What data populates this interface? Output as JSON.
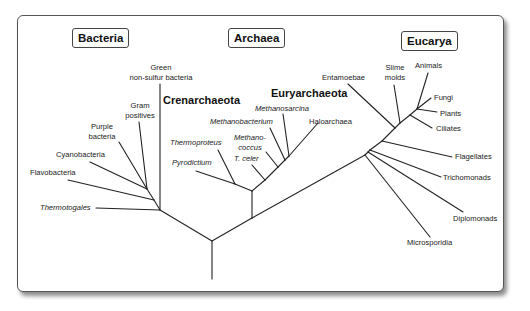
{
  "domains": {
    "bacteria": "Bacteria",
    "archaea": "Archaea",
    "eucarya": "Eucarya"
  },
  "groups": {
    "crenarchaeota": "Crenarchaeota",
    "euryarchaeota": "Euryarchaeota"
  },
  "bacteria_taxa": {
    "green_line1": "Green",
    "green_line2": "non-sulfur bacteria",
    "gram_line1": "Gram",
    "gram_line2": "positives",
    "purple_line1": "Purple",
    "purple_line2": "bacteria",
    "cyanobacteria": "Cyanobacteria",
    "flavobacteria": "Flavobacteria",
    "thermotogales": "Thermotogales"
  },
  "archaea_taxa": {
    "methanosarcina": "Methanosarcina",
    "methanobacterium": "Methanobacterium",
    "haloarchaea": "Haloarchaea",
    "methanococcus_line1": "Methano-",
    "methanococcus_line2": "coccus",
    "t_celer": "T. celer",
    "thermoproteus": "Thermoproteus",
    "pyrodictium": "Pyrodictium"
  },
  "eucarya_taxa": {
    "entamoebae": "Entamoebae",
    "slime_line1": "Slime",
    "slime_line2": "molds",
    "animals": "Animals",
    "fungi": "Fungi",
    "plants": "Plants",
    "ciliates": "Ciliates",
    "flagellates": "Flagellates",
    "trichomonads": "Trichomonads",
    "diplomonads": "Diplomonads",
    "microsporidia": "Microsporidia"
  },
  "colors": {
    "line": "#222222",
    "frame_border": "#555555",
    "background": "#ffffff"
  }
}
